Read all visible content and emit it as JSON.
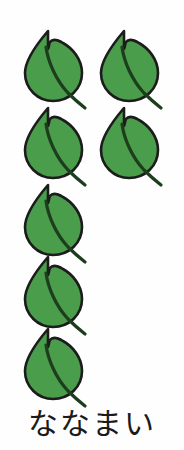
{
  "card": {
    "type": "counting-flashcard",
    "background_color": "#fefefe",
    "subject": "leaves"
  },
  "illustration": {
    "name": "leaf-cluster",
    "total_count": 7,
    "columns": 2,
    "left_column_count": 5,
    "right_column_count": 2,
    "leaf_fill_color": "#4a9d4a",
    "leaf_outline_color": "#1c1c1c",
    "leaf_vein_color": "#1d3d1d",
    "leaves": [
      {
        "index": 1,
        "column": "left",
        "row": 1,
        "x": 22,
        "y": 28
      },
      {
        "index": 2,
        "column": "right",
        "row": 1,
        "x": 98,
        "y": 28
      },
      {
        "index": 3,
        "column": "left",
        "row": 2,
        "x": 22,
        "y": 105
      },
      {
        "index": 4,
        "column": "right",
        "row": 2,
        "x": 98,
        "y": 105
      },
      {
        "index": 5,
        "column": "left",
        "row": 3,
        "x": 22,
        "y": 182
      },
      {
        "index": 6,
        "column": "left",
        "row": 4,
        "x": 22,
        "y": 254
      },
      {
        "index": 7,
        "column": "left",
        "row": 5,
        "x": 22,
        "y": 326
      }
    ]
  },
  "caption": {
    "text": "ななまい",
    "characters": [
      "な",
      "な",
      "ま",
      "い"
    ],
    "color": "#1a1a1a"
  }
}
